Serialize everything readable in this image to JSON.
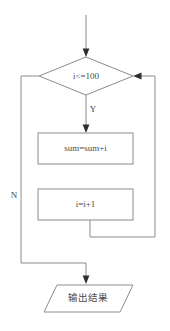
{
  "diagram": {
    "colors": {
      "background": "#ffffff",
      "stroke": "#8c8c8c",
      "text": "#4a4a4a",
      "arrow": "#2f2f2f"
    },
    "nodes": {
      "decision": {
        "shape": "diamond",
        "label": "i<=100"
      },
      "process_sum": {
        "shape": "rectangle",
        "label": "sum=sum+i"
      },
      "process_increment": {
        "shape": "rectangle",
        "label": "i=i+1"
      },
      "output": {
        "shape": "parallelogram",
        "label": "输出结果"
      }
    },
    "branches": {
      "yes": "Y",
      "no": "N"
    }
  }
}
